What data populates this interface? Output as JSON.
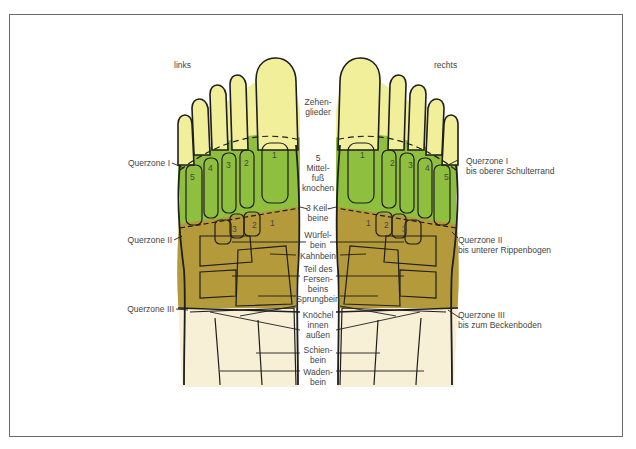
{
  "diagram": {
    "side_labels": {
      "left": "links",
      "right": "rechts"
    },
    "center_labels": {
      "toes": "Zehen-\nglieder",
      "metatarsal": "5\nMittel-\nfuß\nknochen",
      "cuneiform": "3 Keil-\nbeine",
      "cuboid": "Würfel-\nbein",
      "navicular": "Kahnbein",
      "calcaneus": "Teil des\nFersen-\nbeins",
      "talus": "Sprungbein",
      "ankle": "Knöchel\ninnen\naußen",
      "tibia": "Schien-\nbein",
      "fibula": "Waden-\nbein"
    },
    "left_zones": [
      {
        "label": "Querzone I"
      },
      {
        "label": "Querzone II"
      },
      {
        "label": "Querzone III"
      }
    ],
    "right_zones": [
      {
        "label": "Querzone I",
        "sub": "bis oberer Schulterrand"
      },
      {
        "label": "Querzone II",
        "sub": "bis unterer Rippenbogen"
      },
      {
        "label": "Querzone III",
        "sub": "bis zum Beckenboden"
      }
    ],
    "metatarsal_numbers": [
      "1",
      "2",
      "3",
      "4",
      "5"
    ],
    "cuneiform_numbers": [
      "1",
      "2",
      "3"
    ],
    "colors": {
      "toes_zone": "#f2ef9a",
      "metatarsal_zone": "#8fbf3f",
      "tarsal_zone": "#b49a3a",
      "leg_zone": "#f7efd6",
      "outline": "#1e1e1e",
      "frame": "#6a6a6a"
    }
  }
}
